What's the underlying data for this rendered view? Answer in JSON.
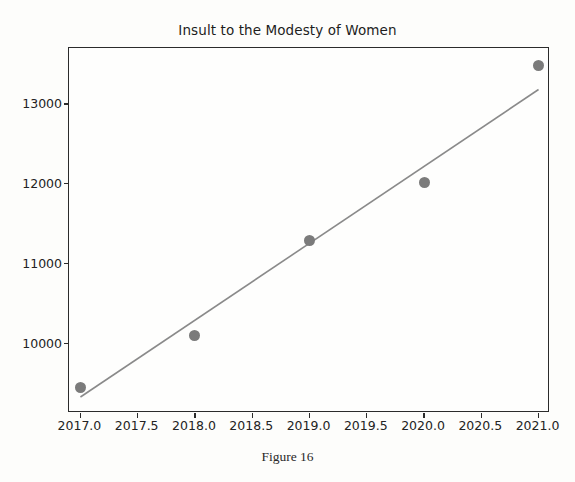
{
  "figure": {
    "caption": "Figure 16"
  },
  "chart_data": {
    "type": "scatter",
    "title": "Insult to the Modesty of Women",
    "xlabel": "",
    "ylabel": "",
    "x": [
      2017,
      2018,
      2019,
      2020,
      2021
    ],
    "values": [
      9450,
      10100,
      11290,
      12010,
      13480
    ],
    "series": [
      {
        "name": "Insult to the Modesty of Women",
        "marker": "circle",
        "color": "#7b7b7b",
        "values": [
          9450,
          10100,
          11290,
          12010,
          13480
        ]
      },
      {
        "name": "trend line",
        "type": "line",
        "color": "#8a8a8a",
        "x": [
          2017.0,
          2021.0
        ],
        "values": [
          9330,
          13180
        ]
      }
    ],
    "xticks": [
      "2017.0",
      "2017.5",
      "2018.0",
      "2018.5",
      "2019.0",
      "2019.5",
      "2020.0",
      "2020.5",
      "2021.0"
    ],
    "xtick_values": [
      2017.0,
      2017.5,
      2018.0,
      2018.5,
      2019.0,
      2019.5,
      2020.0,
      2020.5,
      2021.0
    ],
    "yticks": [
      "10000",
      "11000",
      "12000",
      "13000"
    ],
    "ytick_values": [
      10000,
      11000,
      12000,
      13000
    ],
    "xlim": [
      2016.9,
      2021.1
    ],
    "ylim": [
      9130,
      13700
    ],
    "grid": false,
    "legend": null,
    "marker_color": "#7b7b7b",
    "line_color": "#8a8a8a",
    "axis_color": "#2b2b2b",
    "background": "#fdfdfb"
  }
}
